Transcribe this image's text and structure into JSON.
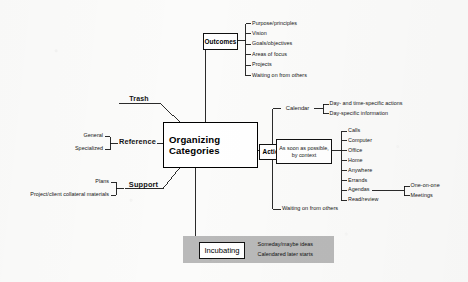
{
  "diagram": {
    "type": "mind-map",
    "title": "Organizing Categories",
    "center": {
      "line1": "Organizing",
      "line2": "Categories"
    },
    "branches": {
      "outcomes": {
        "label": "Outcomes",
        "items": [
          "Purpose/principles",
          "Vision",
          "Goals/objectives",
          "Areas of focus",
          "Projects",
          "Waiting on from others"
        ]
      },
      "trash": {
        "label": "Trash",
        "items": []
      },
      "reference": {
        "label": "Reference",
        "items": [
          "General",
          "Specialized"
        ]
      },
      "support": {
        "label": "Support",
        "items": [
          "Plans",
          "Project/client collateral materials"
        ]
      },
      "actions": {
        "label": "Actions",
        "groups": [
          {
            "name": "Calendar",
            "items": [
              "Day- and time-specific actions",
              "Day-specific information"
            ]
          },
          {
            "name": "As soon as possible, by context",
            "name_line1": "As soon as possible,",
            "name_line2": "by context",
            "items": [
              "Calls",
              "Computer",
              "Office",
              "Home",
              "Anywhere",
              "Errands",
              "Agendas",
              "Read/review"
            ],
            "sub": {
              "parent": "Agendas",
              "items": [
                "One-on-one",
                "Meetings"
              ]
            }
          },
          {
            "name": "Waiting on from others",
            "items": []
          }
        ]
      },
      "incubating": {
        "label": "Incubating",
        "items": [
          "Someday/maybe ideas",
          "Calendared later starts"
        ]
      }
    },
    "colors": {
      "paper": "#fbfbfa",
      "ink": "#111111",
      "highlight_band": "#b9b9b9",
      "box_fill": "#ffffff"
    }
  }
}
